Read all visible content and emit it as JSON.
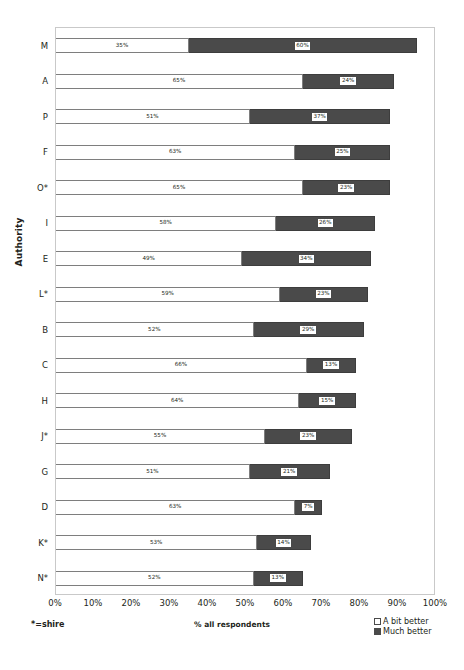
{
  "chart_data": {
    "type": "bar",
    "orientation": "horizontal",
    "stacked": true,
    "title": "",
    "xlabel": "% all respondents",
    "ylabel": "Authority",
    "xlim": [
      0,
      100
    ],
    "xticks": [
      "0%",
      "10%",
      "20%",
      "30%",
      "40%",
      "50%",
      "60%",
      "70%",
      "80%",
      "90%",
      "100%"
    ],
    "xtick_values": [
      0,
      10,
      20,
      30,
      40,
      50,
      60,
      70,
      80,
      90,
      100
    ],
    "grid": false,
    "legend_position": "bottom-right",
    "categories": [
      "M",
      "A",
      "P",
      "F",
      "O*",
      "I",
      "E",
      "L*",
      "B",
      "C",
      "H",
      "J*",
      "G",
      "D",
      "K*",
      "N*"
    ],
    "series": [
      {
        "name": "A bit better",
        "color": "#ffffff",
        "values": [
          35,
          65,
          51,
          63,
          65,
          58,
          49,
          59,
          52,
          66,
          64,
          55,
          51,
          63,
          53,
          52
        ],
        "labels": [
          "35%",
          "65%",
          "51%",
          "63%",
          "65%",
          "58%",
          "49%",
          "59%",
          "52%",
          "66%",
          "64%",
          "55%",
          "51%",
          "63%",
          "53%",
          "52%"
        ]
      },
      {
        "name": "Much better",
        "color": "#4a4a4a",
        "values": [
          60,
          24,
          37,
          25,
          23,
          26,
          34,
          23,
          29,
          13,
          15,
          23,
          21,
          7,
          14,
          13
        ],
        "labels": [
          "60%",
          "24%",
          "37%",
          "25%",
          "23%",
          "26%",
          "34%",
          "23%",
          "29%",
          "13%",
          "15%",
          "23%",
          "21%",
          "7%",
          "14%",
          "13%"
        ]
      }
    ],
    "annotations": [
      "*=shire"
    ]
  },
  "footnote": "*=shire",
  "legend": {
    "items": [
      {
        "label": "A bit better",
        "color": "#ffffff"
      },
      {
        "label": "Much better",
        "color": "#4a4a4a"
      }
    ]
  }
}
